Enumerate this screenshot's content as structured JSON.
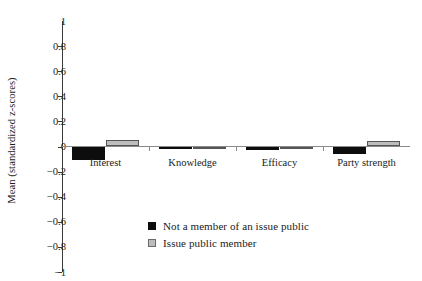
{
  "chart_data": {
    "type": "bar",
    "title": "",
    "subtitle": "",
    "xlabel": "",
    "ylabel": "Mean (standardized z-scores)",
    "categories": [
      "Interest",
      "Knowledge",
      "Efficacy",
      "Party strength"
    ],
    "series": [
      {
        "name": "Not a member of an issue public",
        "color": "#0d0d0d",
        "values": [
          -0.11,
          -0.02,
          -0.03,
          -0.06
        ]
      },
      {
        "name": "Issue public member",
        "color": "#bdbdbd",
        "values": [
          0.05,
          -0.01,
          -0.005,
          0.04
        ]
      }
    ],
    "ylim": [
      -1,
      1
    ],
    "ytick_labels": [
      "1",
      "0.8",
      "0.6",
      "0.4",
      "0.2",
      "0",
      "-0.2",
      "-0.4",
      "-0.6",
      "-0.8",
      "-1"
    ],
    "ytick_values": [
      1,
      0.8,
      0.6,
      0.4,
      0.2,
      0,
      -0.2,
      -0.4,
      -0.6,
      -0.8,
      -1
    ],
    "grid": false,
    "legend_position": "bottom-center",
    "legend": [
      {
        "label": "Not a member of an issue public",
        "swatch": "black"
      },
      {
        "label": "Issue public member",
        "swatch": "gray"
      }
    ]
  },
  "icons": {
    "legend_swatch_black": "filled-square-icon",
    "legend_swatch_gray": "outlined-square-icon"
  }
}
